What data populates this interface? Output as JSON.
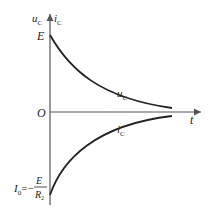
{
  "diagram": {
    "type": "exponential capacitor discharge curves",
    "axes": {
      "y_left_label": "u",
      "y_left_sub": "C",
      "y_right_label": "i",
      "y_right_sub": "C",
      "x_label": "t",
      "origin_label": "O"
    },
    "levels": {
      "top_label": "E",
      "bottom_label_lhs": "I",
      "bottom_label_lhs_sub": "0",
      "bottom_label_eq": "=−",
      "bottom_frac_num": "E",
      "bottom_frac_den": "R",
      "bottom_frac_den_sub": "2"
    },
    "curves": [
      {
        "name": "u_c",
        "label": "u",
        "sub": "C",
        "start": "E",
        "end": 0,
        "shape": "decay"
      },
      {
        "name": "i_c",
        "label": "i",
        "sub": "C",
        "start": "-E/R2",
        "end": 0,
        "shape": "rise"
      }
    ],
    "colors": {
      "axis": "#555555",
      "curve": "#222222",
      "text": "#222222"
    }
  }
}
